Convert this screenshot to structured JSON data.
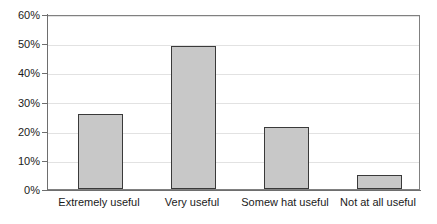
{
  "chart_data": {
    "type": "bar",
    "title": "",
    "subtitle": "",
    "xlabel": "",
    "ylabel": "",
    "categories": [
      "Extremely useful",
      "Very useful",
      "Somew hat useful",
      "Not at all useful"
    ],
    "values": [
      26,
      49.5,
      21.5,
      4.8
    ],
    "value_labels": [
      "",
      "",
      "",
      ""
    ],
    "ylim": [
      0,
      60
    ],
    "ytick_labels": [
      "0%",
      "10%",
      "20%",
      "30%",
      "40%",
      "50%",
      "60%"
    ],
    "ytick_values": [
      0,
      10,
      20,
      30,
      40,
      50,
      60
    ],
    "grid": true,
    "grid_axis": "y",
    "legend": false,
    "legend_position": "none",
    "series": [
      {
        "name": "Percent of respondents",
        "values": [
          26,
          49.5,
          21.5,
          4.8
        ]
      }
    ],
    "colors": {
      "bar_fill": "#c8c8c8",
      "bar_edge": "#3a3a3a",
      "gridline": "#e2e2e2",
      "axis": "#6e6e6e",
      "plot_border": "#808080",
      "text": "#1a1a1a",
      "background": "#ffffff"
    }
  }
}
